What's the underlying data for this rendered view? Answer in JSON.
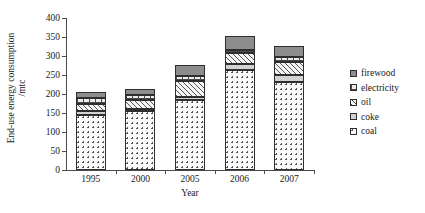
{
  "chart_data": {
    "type": "bar",
    "stacked": true,
    "title": "",
    "xlabel": "Year",
    "ylabel": "End-use energy consumption",
    "ylabel_line2": "/mtc",
    "categories": [
      "1995",
      "2000",
      "2005",
      "2006",
      "2007"
    ],
    "ylim": [
      0,
      400
    ],
    "yticks": [
      0,
      50,
      100,
      150,
      200,
      250,
      300,
      350,
      400
    ],
    "ytick_labels": [
      "0",
      "50",
      "100",
      "150",
      "200",
      "250",
      "300",
      "350",
      "400"
    ],
    "grid": false,
    "legend_position": "right",
    "series": [
      {
        "name": "coal",
        "pattern": "dotted",
        "values": [
          145,
          155,
          185,
          263,
          232
        ]
      },
      {
        "name": "coke",
        "pattern": "light-solid-gray",
        "values": [
          10,
          5,
          8,
          15,
          18
        ]
      },
      {
        "name": "oil",
        "pattern": "diagonal-hatch",
        "values": [
          20,
          25,
          40,
          30,
          35
        ]
      },
      {
        "name": "electricity",
        "pattern": "grid-hatch",
        "values": [
          15,
          12,
          14,
          9,
          12
        ]
      },
      {
        "name": "firewood",
        "pattern": "dark-solid-gray",
        "values": [
          15,
          15,
          30,
          35,
          30
        ]
      }
    ],
    "totals": [
      205,
      212,
      277,
      352,
      327
    ],
    "legend_order_top_to_bottom": [
      "firewood",
      "electricity",
      "oil",
      "coke",
      "coal"
    ]
  },
  "legend": {
    "items": [
      {
        "label": "firewood",
        "key": "firewood"
      },
      {
        "label": "electricity",
        "key": "electricity"
      },
      {
        "label": "oil",
        "key": "oil"
      },
      {
        "label": "coke",
        "key": "coke"
      },
      {
        "label": "coal",
        "key": "coal"
      }
    ]
  },
  "colors": {
    "axis": "#4a4a4a",
    "outline": "#2e2e2e",
    "firewood": "#8d8d8d",
    "coke": "#d2d2d2",
    "background": "#ffffff"
  }
}
